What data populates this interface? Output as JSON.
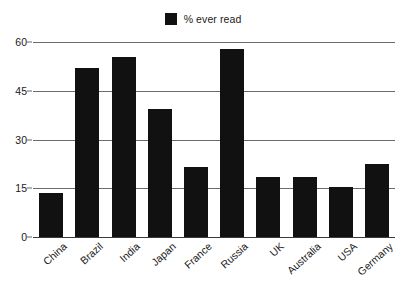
{
  "chart_data": {
    "type": "bar",
    "title": "",
    "subtitle": "",
    "xlabel": "",
    "ylabel": "",
    "categories": [
      "China",
      "Brazil",
      "India",
      "Japan",
      "France",
      "Russia",
      "UK",
      "Australia",
      "USA",
      "Germany"
    ],
    "values": [
      13.5,
      52,
      55.5,
      39.5,
      21.5,
      58,
      18.5,
      18.5,
      15.3,
      22.5
    ],
    "series": [
      {
        "name": "% ever read",
        "values": [
          13.5,
          52,
          55.5,
          39.5,
          21.5,
          58,
          18.5,
          18.5,
          15.3,
          22.5
        ],
        "color": "#111111"
      }
    ],
    "ylim": [
      0,
      60
    ],
    "yticks": [
      0,
      15,
      30,
      45,
      60
    ],
    "ytick_labels": [
      "0",
      "15",
      "30",
      "45",
      "60"
    ],
    "grid": "horizontal",
    "legend_position": "top-center",
    "legend_entries": [
      "% ever read"
    ],
    "annotations": []
  },
  "legend": {
    "label": "% ever read",
    "swatch_color": "#111111"
  },
  "axes": {
    "y": {
      "ticks": [
        {
          "label": "60",
          "value": 60
        },
        {
          "label": "45",
          "value": 45
        },
        {
          "label": "30",
          "value": 30
        },
        {
          "label": "15",
          "value": 15
        },
        {
          "label": "0",
          "value": 0
        }
      ],
      "min": 0,
      "max": 60
    },
    "x": {
      "labels": [
        "China",
        "Brazil",
        "India",
        "Japan",
        "France",
        "Russia",
        "UK",
        "Australia",
        "USA",
        "Germany"
      ]
    }
  },
  "colors": {
    "bar": "#111111",
    "gridline": "#6b6b6b",
    "background": "#ffffff",
    "text": "#1a1a1a"
  }
}
